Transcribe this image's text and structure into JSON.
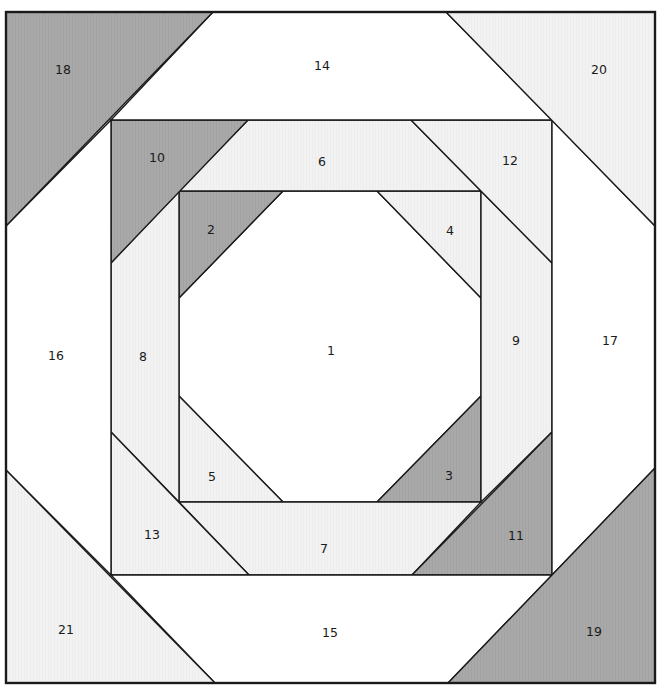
{
  "colors": {
    "white": "#ffffff",
    "light": "#f1f1f1",
    "dark": "#a9a9a9",
    "line": "#1a1a1a"
  },
  "frame": {
    "x": 6,
    "y": 12,
    "width": 649,
    "height": 671
  },
  "pieces": [
    {
      "id": "1",
      "fill": "white",
      "points": "283,191 377,191 481,298 481,396 377,502 283,502 179,396 179,298",
      "label_x": 331,
      "label_y": 350
    },
    {
      "id": "2",
      "fill": "dark",
      "points": "179,191 283,191 179,298",
      "label_x": 211,
      "label_y": 229
    },
    {
      "id": "3",
      "fill": "dark",
      "points": "481,396 481,502 377,502",
      "label_x": 449,
      "label_y": 475
    },
    {
      "id": "4",
      "fill": "light",
      "points": "377,191 481,191 481,298",
      "label_x": 450,
      "label_y": 230
    },
    {
      "id": "5",
      "fill": "light",
      "points": "179,396 179,502 283,502",
      "label_x": 212,
      "label_y": 476
    },
    {
      "id": "6",
      "fill": "light",
      "points": "248,120 411,120 481,191 179,191",
      "label_x": 322,
      "label_y": 161
    },
    {
      "id": "7",
      "fill": "light",
      "points": "179,502 481,502 412,575 249,575",
      "label_x": 324,
      "label_y": 548
    },
    {
      "id": "8",
      "fill": "light",
      "points": "111,263 179,191 179,502 111,432",
      "label_x": 143,
      "label_y": 356
    },
    {
      "id": "9",
      "fill": "light",
      "points": "481,191 552,263 552,432 481,502",
      "label_x": 516,
      "label_y": 340
    },
    {
      "id": "10",
      "fill": "dark",
      "points": "111,120 248,120 111,263",
      "label_x": 157,
      "label_y": 157
    },
    {
      "id": "11",
      "fill": "dark",
      "points": "552,432 552,575 412,575",
      "label_x": 516,
      "label_y": 535
    },
    {
      "id": "12",
      "fill": "light",
      "points": "411,120 552,120 552,263",
      "label_x": 510,
      "label_y": 160
    },
    {
      "id": "13",
      "fill": "light",
      "points": "111,432 111,575 249,575",
      "label_x": 152,
      "label_y": 534
    },
    {
      "id": "14",
      "fill": "white",
      "points": "213,12 446,12 552,120 111,120",
      "label_x": 322,
      "label_y": 65
    },
    {
      "id": "15",
      "fill": "white",
      "points": "111,575 552,575 448,683 215,683",
      "label_x": 330,
      "label_y": 632
    },
    {
      "id": "16",
      "fill": "white",
      "points": "6,226 111,120 111,575 6,470",
      "label_x": 56,
      "label_y": 355
    },
    {
      "id": "17",
      "fill": "white",
      "points": "552,120 655,226 655,468 552,575",
      "label_x": 610,
      "label_y": 340
    },
    {
      "id": "18",
      "fill": "dark",
      "points": "6,12 213,12 6,226",
      "label_x": 63,
      "label_y": 69
    },
    {
      "id": "19",
      "fill": "dark",
      "points": "655,468 655,683 448,683",
      "label_x": 594,
      "label_y": 631
    },
    {
      "id": "20",
      "fill": "light",
      "points": "446,12 655,12 655,226",
      "label_x": 599,
      "label_y": 69
    },
    {
      "id": "21",
      "fill": "light",
      "points": "6,470 6,683 215,683",
      "label_x": 66,
      "label_y": 629
    }
  ]
}
